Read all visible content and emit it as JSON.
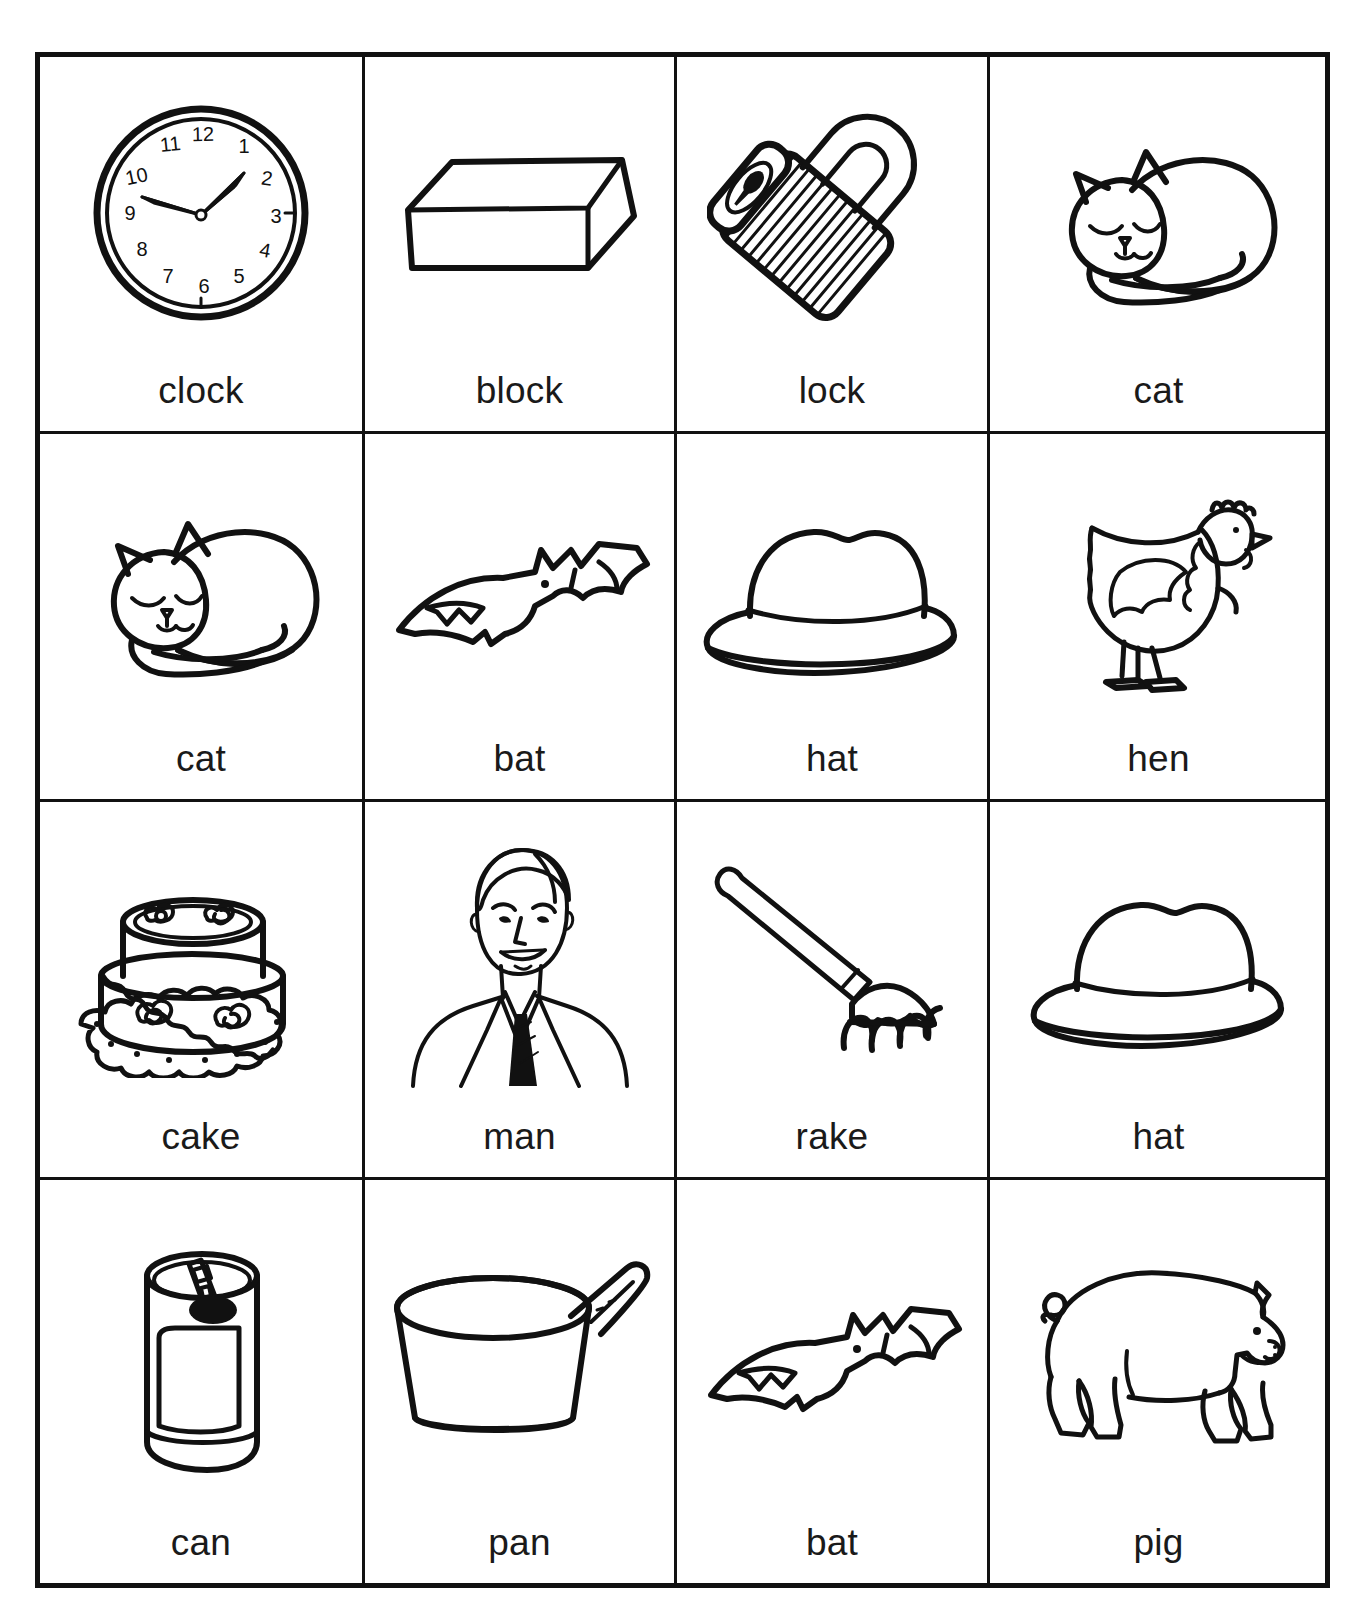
{
  "page": {
    "top_note": "",
    "background_color": "#ffffff",
    "ink_color": "#111111",
    "border_color": "#111111"
  },
  "grid": {
    "rows": 4,
    "columns": 4,
    "cells": [
      {
        "label": "clock",
        "icon": "wall-clock-icon"
      },
      {
        "label": "block",
        "icon": "rectangular-block-icon"
      },
      {
        "label": "lock",
        "icon": "padlock-icon"
      },
      {
        "label": "cat",
        "icon": "sleeping-cat-icon"
      },
      {
        "label": "cat",
        "icon": "sleeping-cat-icon"
      },
      {
        "label": "bat",
        "icon": "flying-bat-icon"
      },
      {
        "label": "hat",
        "icon": "fedora-hat-icon"
      },
      {
        "label": "hen",
        "icon": "hen-icon"
      },
      {
        "label": "cake",
        "icon": "layer-cake-icon"
      },
      {
        "label": "man",
        "icon": "man-portrait-icon"
      },
      {
        "label": "rake",
        "icon": "garden-rake-icon"
      },
      {
        "label": "hat",
        "icon": "fedora-hat-icon"
      },
      {
        "label": "can",
        "icon": "soda-can-icon"
      },
      {
        "label": "pan",
        "icon": "sauce-pan-icon"
      },
      {
        "label": "bat",
        "icon": "flying-bat-icon"
      },
      {
        "label": "pig",
        "icon": "pig-icon"
      }
    ]
  },
  "clock_face": {
    "numerals": [
      "12",
      "1",
      "2",
      "3",
      "4",
      "5",
      "6",
      "7",
      "8",
      "9",
      "10",
      "11"
    ],
    "hour_hand_points_to": "2",
    "minute_hand_points_to": "9"
  }
}
